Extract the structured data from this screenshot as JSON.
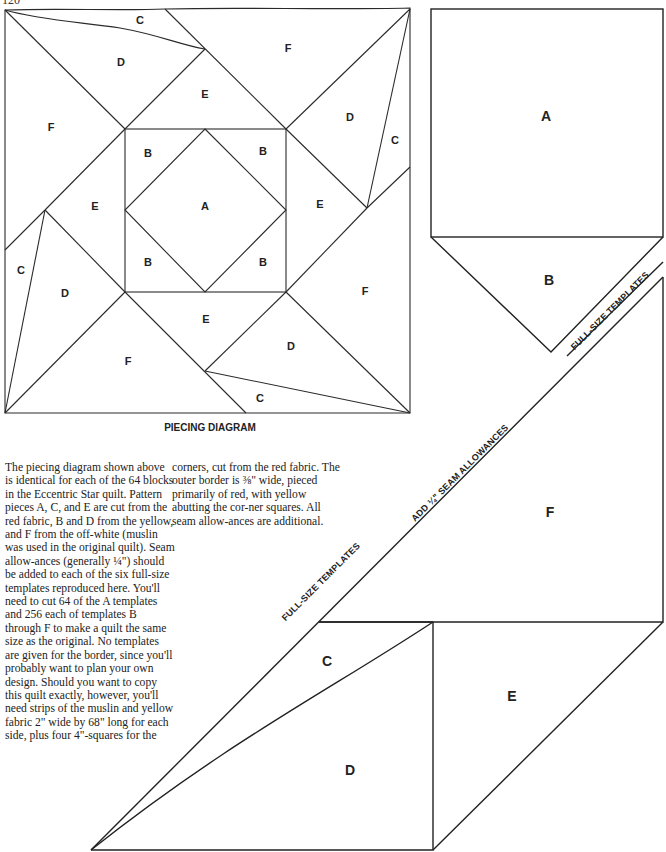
{
  "page_number": "120",
  "piecing_diagram": {
    "caption": "PIECING DIAGRAM",
    "labels": {
      "top_c": "C",
      "top_d": "D",
      "top_f": "F",
      "top_e": "E",
      "left_f": "F",
      "right_d": "D",
      "right_c": "C",
      "b_tl": "B",
      "b_tr": "B",
      "b_bl": "B",
      "b_br": "B",
      "center_a": "A",
      "left_e": "E",
      "right_e": "E",
      "left_c": "C",
      "left_d": "D",
      "right_f": "F",
      "bottom_e": "E",
      "bottom_f": "F",
      "bottom_d": "D",
      "bottom_c": "C"
    }
  },
  "templates": {
    "a": "A",
    "b": "B",
    "c": "C",
    "d": "D",
    "e": "E",
    "f": "F",
    "banner_upper": "FULL-SIZE TEMPLATES",
    "banner_middle": "ADD ¼\" SEAM ALLOWANCES",
    "banner_lower": "FULL-SIZE TEMPLATES"
  },
  "text": {
    "column1": "The piecing diagram shown above is identical for each of the 64 blocks in the Eccentric Star quilt. Pattern pieces A, C, and E are cut from the red fabric, B and D from the yellow, and F from the off-white (muslin was used in the original quilt). Seam allow-ances (generally ¼\") should be added to each of the six full-size templates reproduced here. You'll need to cut 64 of the A templates and 256 each of templates B through F to make a quilt the same size as the original. No templates are given for the border, since you'll probably want to plan your own design. Should you want to copy this quilt exactly, however, you'll need strips of the muslin and yellow fabric 2\" wide by 68\" long for each side, plus four 4\"-squares for the",
    "column2": "corners, cut from the red fabric. The outer border is ⅜\" wide, pieced primarily of red, with yellow abutting the cor-ner squares. All seam allow-ances are additional."
  }
}
